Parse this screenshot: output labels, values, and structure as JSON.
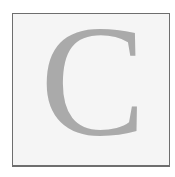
{
  "tile": {
    "letter": "C",
    "letter_color": "#aaaaaa",
    "background_color": "#f5f5f5",
    "border_color": "#6e6e6e"
  }
}
